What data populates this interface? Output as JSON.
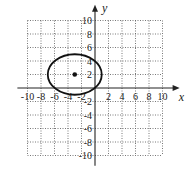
{
  "chart_data": {
    "type": "scatter",
    "title": "",
    "xlabel": "x",
    "ylabel": "y",
    "xlim": [
      -10,
      10
    ],
    "ylim": [
      -10,
      10
    ],
    "grid": true,
    "grid_style": "dotted",
    "grid_step": 2,
    "x_ticks": [
      -10,
      -8,
      -6,
      -4,
      -2,
      2,
      4,
      6,
      8,
      10
    ],
    "y_ticks": [
      10,
      8,
      6,
      4,
      2,
      -2,
      -4,
      -6,
      -8,
      -10
    ],
    "shapes": [
      {
        "kind": "ellipse",
        "center": [
          -3,
          2
        ],
        "rx": 4,
        "ry": 3,
        "stroke": "#111111"
      }
    ],
    "points": [
      {
        "x": -3,
        "y": 2,
        "label": "center"
      }
    ]
  },
  "axes": {
    "x_label": "x",
    "y_label": "y"
  },
  "colors": {
    "axis": "#222222",
    "grid": "#555555",
    "curve": "#111111"
  }
}
